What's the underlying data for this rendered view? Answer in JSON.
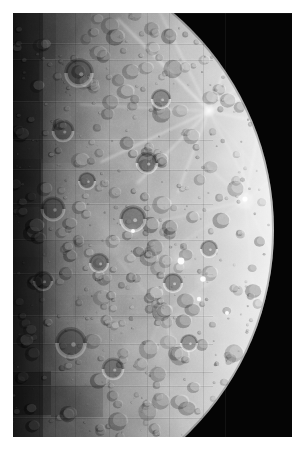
{
  "image": {
    "kind": "planetary-photograph",
    "subject": "Mercury",
    "mission": "Mariner 10 photomosaic",
    "caption": "",
    "border_color": "#ffffff",
    "sky_color": "#050505",
    "width": 301,
    "height": 456,
    "plate": {
      "x": 13,
      "y": 13,
      "width": 279,
      "height": 424
    }
  },
  "planet": {
    "name": "Mercury",
    "center_x": -24,
    "center_y": 217,
    "radius": 285,
    "limb_highlight_color": "#f4f4f4",
    "terminator_color": "#3a3a3a",
    "midtone_color": "#a8a8a8",
    "phase": "right-limb illuminated, left terminator",
    "illumination_direction": "from the right"
  },
  "mosaic": {
    "description": "rectangular image-frame seams with slight brightness mismatch",
    "tiles": [
      {
        "x": 0,
        "y": 0,
        "w": 42,
        "h": 46,
        "tint": -0.26
      },
      {
        "x": 42,
        "y": 0,
        "w": 36,
        "h": 30,
        "tint": -0.1
      },
      {
        "x": 0,
        "y": 46,
        "w": 26,
        "h": 42,
        "tint": -0.4
      },
      {
        "x": 0,
        "y": 88,
        "w": 30,
        "h": 58,
        "tint": -0.16
      },
      {
        "x": 26,
        "y": 88,
        "w": 32,
        "h": 34,
        "tint": 0.08
      },
      {
        "x": 0,
        "y": 146,
        "w": 28,
        "h": 48,
        "tint": -0.3
      },
      {
        "x": 28,
        "y": 150,
        "w": 44,
        "h": 40,
        "tint": 0.1
      },
      {
        "x": 0,
        "y": 194,
        "w": 34,
        "h": 50,
        "tint": -0.14
      },
      {
        "x": 34,
        "y": 190,
        "w": 62,
        "h": 36,
        "tint": 0.12
      },
      {
        "x": 62,
        "y": 126,
        "w": 72,
        "h": 30,
        "tint": 0.09
      },
      {
        "x": 96,
        "y": 60,
        "w": 60,
        "h": 26,
        "tint": 0.07
      },
      {
        "x": 0,
        "y": 244,
        "w": 30,
        "h": 58,
        "tint": -0.22
      },
      {
        "x": 0,
        "y": 302,
        "w": 32,
        "h": 56,
        "tint": -0.08
      },
      {
        "x": 32,
        "y": 302,
        "w": 40,
        "h": 28,
        "tint": 0.06
      },
      {
        "x": 0,
        "y": 358,
        "w": 38,
        "h": 44,
        "tint": -0.5
      },
      {
        "x": 38,
        "y": 372,
        "w": 52,
        "h": 32,
        "tint": -0.24
      },
      {
        "x": 70,
        "y": 232,
        "w": 86,
        "h": 28,
        "tint": 0.07
      },
      {
        "x": 60,
        "y": 282,
        "w": 96,
        "h": 24,
        "tint": -0.06
      },
      {
        "x": 110,
        "y": 330,
        "w": 80,
        "h": 22,
        "tint": 0.05
      }
    ],
    "seam_lines_y": [
      30,
      46,
      88,
      126,
      156,
      190,
      226,
      260,
      302,
      330,
      358,
      372,
      404
    ],
    "seam_lines_x": [
      26,
      42,
      62,
      96,
      134,
      156,
      190
    ]
  },
  "features": {
    "ray_systems": [
      {
        "cx": 196,
        "cy": 98,
        "rays": 12,
        "length": 130,
        "brightness": 0.55
      },
      {
        "cx": 232,
        "cy": 188,
        "rays": 9,
        "length": 90,
        "brightness": 0.35
      },
      {
        "cx": 150,
        "cy": 300,
        "rays": 7,
        "length": 70,
        "brightness": 0.22
      }
    ],
    "crater_count": 520,
    "large_craters": [
      {
        "cx": 66,
        "cy": 60,
        "r": 13
      },
      {
        "cx": 50,
        "cy": 118,
        "r": 10
      },
      {
        "cx": 40,
        "cy": 196,
        "r": 11
      },
      {
        "cx": 86,
        "cy": 250,
        "r": 9
      },
      {
        "cx": 120,
        "cy": 206,
        "r": 12
      },
      {
        "cx": 58,
        "cy": 330,
        "r": 14
      },
      {
        "cx": 100,
        "cy": 356,
        "r": 10
      },
      {
        "cx": 160,
        "cy": 270,
        "r": 9
      },
      {
        "cx": 196,
        "cy": 236,
        "r": 8
      },
      {
        "cx": 134,
        "cy": 150,
        "r": 10
      },
      {
        "cx": 74,
        "cy": 168,
        "r": 8
      },
      {
        "cx": 148,
        "cy": 86,
        "r": 9
      },
      {
        "cx": 176,
        "cy": 330,
        "r": 8
      },
      {
        "cx": 30,
        "cy": 268,
        "r": 9
      }
    ],
    "bright_spots": [
      {
        "cx": 168,
        "cy": 248,
        "r": 3.4
      },
      {
        "cx": 190,
        "cy": 266,
        "r": 2.8
      },
      {
        "cx": 186,
        "cy": 286,
        "r": 2.2
      },
      {
        "cx": 120,
        "cy": 218,
        "r": 2.0
      },
      {
        "cx": 232,
        "cy": 186,
        "r": 2.6
      },
      {
        "cx": 214,
        "cy": 300,
        "r": 2.0
      }
    ]
  }
}
